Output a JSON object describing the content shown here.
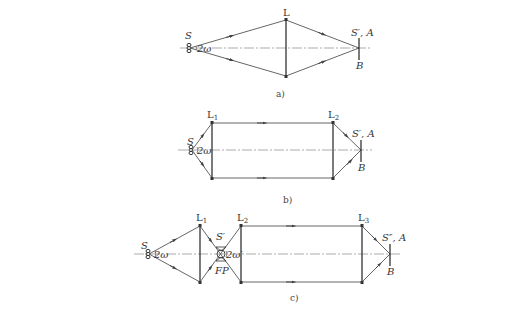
{
  "figure": {
    "colors": {
      "ray": "#555555",
      "lens": "#333333",
      "axis": "#888888"
    },
    "a": {
      "caption": "a)",
      "lens_label": "L",
      "source_label": "S",
      "angle_label": "2ω",
      "image_label": "S′, A",
      "bottom_label": "B"
    },
    "b": {
      "caption": "b)",
      "lens1_label": "L",
      "lens1_sub": "1",
      "lens2_label": "L",
      "lens2_sub": "2",
      "source_label": "S",
      "angle_label": "2ω",
      "image_label": "S′, A",
      "bottom_label": "B"
    },
    "c": {
      "caption": "c)",
      "lens1_label": "L",
      "lens1_sub": "1",
      "lens2_label": "L",
      "lens2_sub": "2",
      "lens3_label": "L",
      "lens3_sub": "3",
      "source_label": "S",
      "angle_label": "2ω",
      "field_stop_top_label": "S′",
      "angle2_label": "2ω′",
      "field_stop_label": "FP",
      "image_label": "S″, A",
      "bottom_label": "B"
    }
  }
}
